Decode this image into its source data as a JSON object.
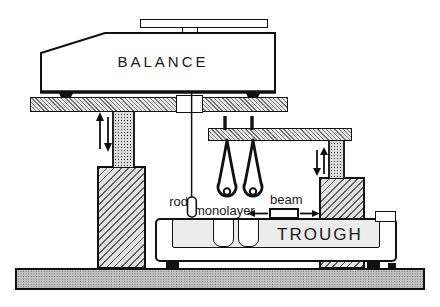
{
  "labels": {
    "balance": "BALANCE",
    "trough": "TROUGH",
    "rod": "rod",
    "monolayer": "monolayer",
    "beam": "beam"
  },
  "icons": {
    "left_lift_arrows": "up-down-arrows",
    "right_lift_arrows": "up-down-arrows",
    "beam_motion_arrows": "left-right-arrows"
  },
  "colors": {
    "ink": "#111111",
    "paper": "#ffffff",
    "hatch_fill": "#e9e9e9",
    "pillar_fill": "#e2e2e2",
    "column_fill": "#dddddd",
    "baseplate_fill": "#c8c8c8",
    "trough_liquid": "#ececec"
  }
}
